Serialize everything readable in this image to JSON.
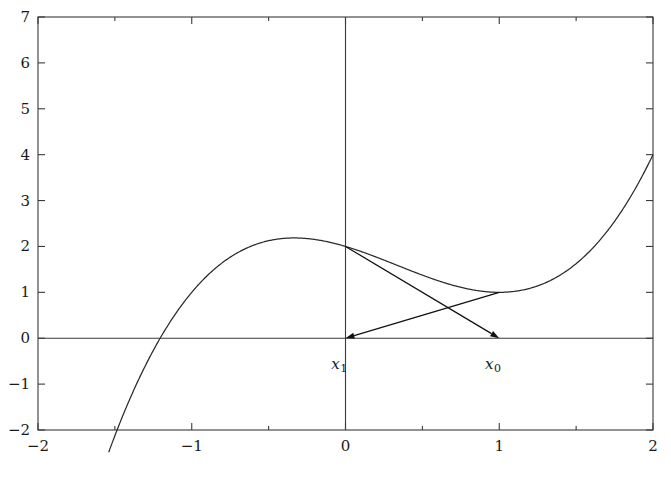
{
  "figure": {
    "kind": "newton-method-illustration",
    "background_color": "#ffffff",
    "axis_color": "#3a3a3a",
    "curve_color": "#2b2b2b",
    "tangent_color": "#111111",
    "text_color": "#1a1a1a"
  },
  "axes": {
    "x": {
      "min": -2,
      "max": 2,
      "tick_labels": [
        "-2",
        "-1",
        "0",
        "1",
        "2"
      ],
      "tick_values": [
        -2,
        -1,
        0,
        1,
        2
      ],
      "minor_tick_values": [
        -1.5,
        -0.5,
        0.5,
        1.5
      ]
    },
    "y": {
      "min": -2,
      "max": 7,
      "tick_labels": [
        "-2",
        "-1",
        "0",
        "1",
        "2",
        "3",
        "4",
        "5",
        "6",
        "7"
      ],
      "tick_values": [
        -2,
        -1,
        0,
        1,
        2,
        3,
        4,
        5,
        6,
        7
      ],
      "minor_tick_values": []
    }
  },
  "annotations": [
    {
      "name": "x1-label",
      "text": "x",
      "sub": "1",
      "x": -0.04,
      "y": -0.42
    },
    {
      "name": "x0-label",
      "text": "x",
      "sub": "0",
      "x": 0.96,
      "y": -0.42
    }
  ],
  "chart_data": {
    "type": "line",
    "title": "",
    "xlabel": "",
    "ylabel": "",
    "xlim": [
      -2,
      2
    ],
    "ylim": [
      -2,
      7
    ],
    "grid": false,
    "legend": null,
    "series": [
      {
        "name": "f(x) = x^3 - x^2 - x + 2",
        "kind": "curve",
        "x": [
          -2.0,
          -1.9,
          -1.8,
          -1.7,
          -1.6,
          -1.5,
          -1.4,
          -1.3,
          -1.2,
          -1.1,
          -1.0,
          -0.9,
          -0.8,
          -0.7,
          -0.6,
          -0.5,
          -0.4,
          -0.3,
          -0.2,
          -0.1,
          0.0,
          0.1,
          0.2,
          0.3,
          0.4,
          0.5,
          0.6,
          0.7,
          0.8,
          0.9,
          1.0,
          1.1,
          1.2,
          1.3,
          1.4,
          1.5,
          1.6,
          1.7,
          1.8,
          1.9,
          2.0
        ],
        "y": [
          -2.0,
          -1.561,
          -1.072,
          -0.533,
          0.056,
          0.875,
          0.896,
          1.213,
          1.032,
          0.861,
          1.0,
          1.361,
          1.648,
          1.867,
          2.024,
          2.125,
          2.176,
          2.183,
          2.152,
          2.089,
          2.0,
          1.891,
          1.768,
          1.637,
          1.504,
          1.375,
          1.256,
          1.153,
          1.072,
          1.019,
          1.0,
          1.021,
          1.088,
          1.207,
          1.384,
          1.625,
          1.936,
          2.323,
          2.792,
          3.349,
          4.0
        ]
      },
      {
        "name": "tangent-at-x0",
        "kind": "arrow",
        "from": {
          "x": 1.0,
          "y": 1.0
        },
        "to": {
          "x": 0.0,
          "y": 0.0
        },
        "description": "tangent line at x0 drawn back to its x-intercept x1"
      },
      {
        "name": "tangent-at-x1",
        "kind": "arrow",
        "from": {
          "x": 0.0,
          "y": 2.0
        },
        "to": {
          "x": 1.0,
          "y": 0.0
        },
        "description": "tangent line at x1 drawn to its x-intercept"
      }
    ],
    "notable_points": [
      {
        "name": "local-maximum",
        "x": -0.82,
        "y": 3.1
      },
      {
        "name": "local-minimum",
        "x": 0.85,
        "y": 1.05
      },
      {
        "name": "left-root",
        "x": -1.8,
        "y": 0.0
      },
      {
        "name": "f-at-minus-2",
        "x": -2.0,
        "y": -2.0
      },
      {
        "name": "f-at-0",
        "x": 0.0,
        "y": 2.0
      },
      {
        "name": "f-at-1",
        "x": 1.0,
        "y": 1.1
      },
      {
        "name": "f-at-2",
        "x": 2.0,
        "y": 5.9
      }
    ]
  }
}
